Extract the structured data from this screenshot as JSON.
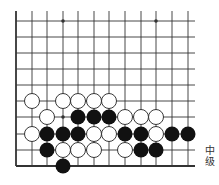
{
  "board": {
    "cols_x": [
      16,
      32,
      47,
      63,
      78,
      94,
      109,
      125,
      141,
      156,
      172,
      188
    ],
    "rows_y": [
      21,
      37,
      53,
      69,
      85,
      101,
      117,
      134,
      150,
      166
    ],
    "line_top": 11,
    "line_right": 195,
    "left_edge_x": 16,
    "bottom_edge_y": 166,
    "stone_radius": 7.5,
    "star_points": [
      [
        3,
        0
      ],
      [
        9,
        0
      ],
      [
        3,
        6
      ]
    ],
    "stones": [
      {
        "color": "white",
        "col": 1,
        "row": 5
      },
      {
        "color": "white",
        "col": 3,
        "row": 5
      },
      {
        "color": "white",
        "col": 4,
        "row": 5
      },
      {
        "color": "white",
        "col": 5,
        "row": 5
      },
      {
        "color": "white",
        "col": 6,
        "row": 5
      },
      {
        "color": "white",
        "col": 2,
        "row": 6
      },
      {
        "color": "black",
        "col": 4,
        "row": 6
      },
      {
        "color": "black",
        "col": 5,
        "row": 6
      },
      {
        "color": "black",
        "col": 6,
        "row": 6
      },
      {
        "color": "white",
        "col": 7,
        "row": 6
      },
      {
        "color": "white",
        "col": 8,
        "row": 6
      },
      {
        "color": "white",
        "col": 9,
        "row": 6
      },
      {
        "color": "white",
        "col": 1,
        "row": 7
      },
      {
        "color": "black",
        "col": 2,
        "row": 7
      },
      {
        "color": "black",
        "col": 3,
        "row": 7
      },
      {
        "color": "black",
        "col": 4,
        "row": 7
      },
      {
        "color": "white",
        "col": 5,
        "row": 7
      },
      {
        "color": "white",
        "col": 6,
        "row": 7
      },
      {
        "color": "black",
        "col": 7,
        "row": 7
      },
      {
        "color": "black",
        "col": 8,
        "row": 7
      },
      {
        "color": "white",
        "col": 9,
        "row": 7
      },
      {
        "color": "black",
        "col": 10,
        "row": 7
      },
      {
        "color": "black",
        "col": 11,
        "row": 7
      },
      {
        "color": "black",
        "col": 2,
        "row": 8
      },
      {
        "color": "white",
        "col": 3,
        "row": 8
      },
      {
        "color": "white",
        "col": 4,
        "row": 8
      },
      {
        "color": "white",
        "col": 5,
        "row": 8
      },
      {
        "color": "white",
        "col": 7,
        "row": 8
      },
      {
        "color": "black",
        "col": 8,
        "row": 8
      },
      {
        "color": "black",
        "col": 9,
        "row": 8
      },
      {
        "color": "black",
        "col": 3,
        "row": 9
      }
    ],
    "colors": {
      "line": "#333333",
      "black_stone": "#111111",
      "white_stone_fill": "#ffffff",
      "white_stone_stroke": "#222222"
    }
  },
  "level_label": "中级"
}
